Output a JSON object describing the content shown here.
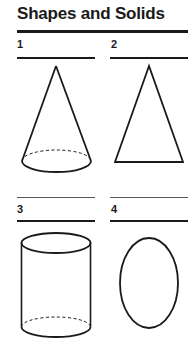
{
  "page": {
    "title": "Shapes and Solids"
  },
  "items": [
    {
      "number": "1",
      "shape": "cone"
    },
    {
      "number": "2",
      "shape": "triangle"
    },
    {
      "number": "3",
      "shape": "cylinder"
    },
    {
      "number": "4",
      "shape": "oval"
    }
  ],
  "colors": {
    "ink": "#1a1a1a",
    "background": "#ffffff"
  }
}
